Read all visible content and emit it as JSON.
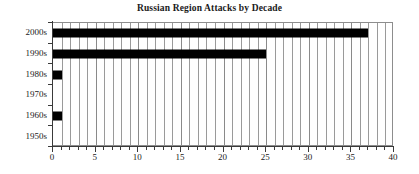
{
  "chart_data": {
    "type": "bar",
    "orientation": "horizontal",
    "title": "Russian Region Attacks by Decade",
    "xlabel": "",
    "ylabel": "",
    "categories": [
      "1950s",
      "1960s",
      "1970s",
      "1980s",
      "1990s",
      "2000s"
    ],
    "values": [
      0,
      1,
      0,
      1,
      25,
      37
    ],
    "categories_top_to_bottom": [
      "2000s",
      "1990s",
      "1980s",
      "1970s",
      "1960s",
      "1950s"
    ],
    "values_top_to_bottom": [
      37,
      25,
      1,
      0,
      1,
      0
    ],
    "xlim": [
      0,
      40
    ],
    "x_major_ticks": [
      0,
      5,
      10,
      15,
      20,
      25,
      30,
      35,
      40
    ],
    "x_major_tick_labels": [
      "0",
      "5",
      "10",
      "15",
      "20",
      "25",
      "30",
      "35",
      "40"
    ],
    "x_minor_tick_step": 1,
    "grid": "vertical-major-and-minor",
    "legend": null,
    "bar_color": "#000000",
    "grid_color": "#9a9a9a",
    "axis_color": "#3a3a3a",
    "background_color": "#ffffff"
  }
}
